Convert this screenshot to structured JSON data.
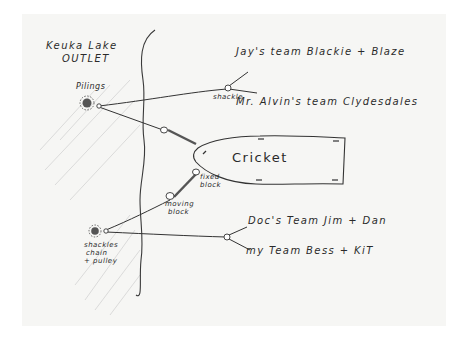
{
  "diagram": {
    "location_label_line1": "Keuka Lake",
    "location_label_line2": "OUTLET",
    "anchors": {
      "pilings": "Pilings",
      "bottom_anchor_line1": "shackles",
      "bottom_anchor_line2": "chain",
      "bottom_anchor_line3": "+ pulley"
    },
    "connectors": {
      "shackle": "shackle",
      "fixed_block_line1": "fixed",
      "fixed_block_line2": "block",
      "moving_block_line1": "moving",
      "moving_block_line2": "block"
    },
    "boat": {
      "name": "Cricket"
    },
    "teams": [
      {
        "label": "Jay's team Blackie + Blaze"
      },
      {
        "label": "Mr. Alvin's team Clydesdales"
      },
      {
        "label": "Doc's Team Jim + Dan"
      },
      {
        "label": "my Team Bess + KiT"
      }
    ],
    "colors": {
      "ink": "#2a2a2a",
      "paper": "#f6f6f4",
      "hatch": "#c8c8c8"
    }
  }
}
